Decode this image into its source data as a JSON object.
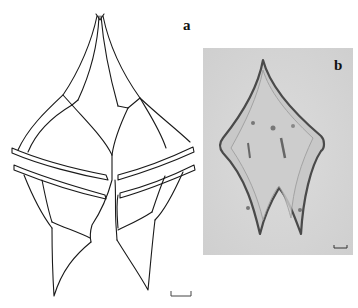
{
  "figure": {
    "panels": [
      {
        "id": "a",
        "label": "a",
        "type": "line-drawing",
        "subject": "dinoflagellate cell outline (ventral view)"
      },
      {
        "id": "b",
        "label": "b",
        "type": "light-micrograph",
        "subject": "dinoflagellate cell"
      }
    ],
    "scale_bars": [
      {
        "panel": "a",
        "length_px": 20
      },
      {
        "panel": "b",
        "length_px": 13
      }
    ],
    "colors": {
      "line": "#1a1a1a",
      "photo_background": "#d8d8d8",
      "cell_fill": "#c9c9c9",
      "cell_outline": "#555555"
    }
  }
}
